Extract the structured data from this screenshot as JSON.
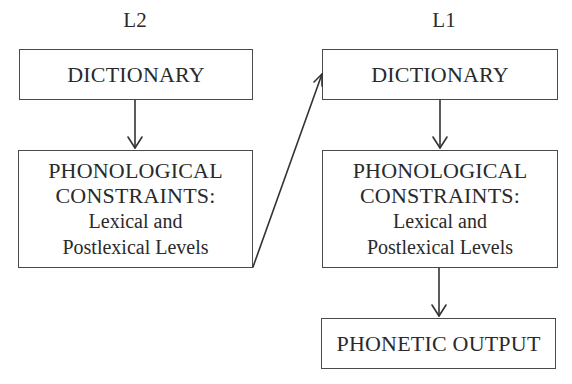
{
  "diagram": {
    "columns": [
      {
        "heading": "L2",
        "dictionary": "DICTIONARY",
        "constraints": {
          "line1": "PHONOLOGICAL",
          "line2": "CONSTRAINTS:",
          "line3": "Lexical and",
          "line4": "Postlexical Levels"
        }
      },
      {
        "heading": "L1",
        "dictionary": "DICTIONARY",
        "constraints": {
          "line1": "PHONOLOGICAL",
          "line2": "CONSTRAINTS:",
          "line3": "Lexical and",
          "line4": "Postlexical Levels"
        },
        "output": "PHONETIC OUTPUT"
      }
    ],
    "edges": [
      {
        "from": "L2 DICTIONARY",
        "to": "L2 PHONOLOGICAL CONSTRAINTS"
      },
      {
        "from": "L2 PHONOLOGICAL CONSTRAINTS",
        "to": "L1 DICTIONARY"
      },
      {
        "from": "L1 DICTIONARY",
        "to": "L1 PHONOLOGICAL CONSTRAINTS"
      },
      {
        "from": "L1 PHONOLOGICAL CONSTRAINTS",
        "to": "PHONETIC OUTPUT"
      }
    ],
    "colors": {
      "line": "#333333",
      "text": "#2a2a2a",
      "background": "#ffffff"
    }
  }
}
